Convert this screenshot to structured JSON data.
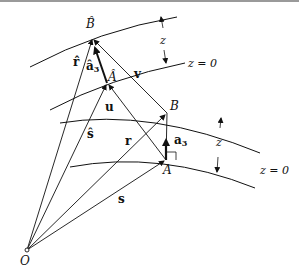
{
  "figure": {
    "points": {
      "origin": "O",
      "A": "A",
      "B": "B",
      "A_hat": "Â",
      "B_hat": "B̂"
    },
    "vectors": {
      "r": "r",
      "s": "s",
      "r_hat": "r̂",
      "s_hat": "ŝ",
      "u": "u",
      "v": "v",
      "a3": "a",
      "a3_sub": "3",
      "a3_hat": "â",
      "a3_hat_sub": "3"
    },
    "surface_labels": {
      "upper_z0": "z = 0",
      "lower_z0": "z = 0",
      "upper_z": "z",
      "lower_z": "z"
    }
  }
}
